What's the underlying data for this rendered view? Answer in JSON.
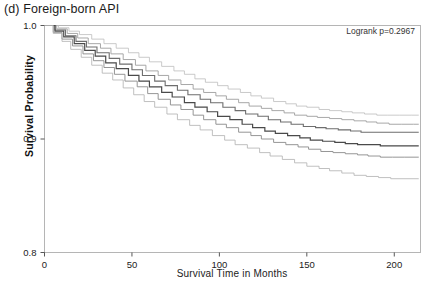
{
  "figure": {
    "panel_title": "(d) Foreign-born API",
    "annotation": "Logrank p=0.2967"
  },
  "chart_data": {
    "type": "line",
    "subtype": "kaplan-meier-step",
    "title": "(d) Foreign-born API",
    "xlabel": "Survival Time in Months",
    "ylabel": "Survival Probability",
    "annotations": [
      "Logrank p=0.2967"
    ],
    "grid": false,
    "legend_position": "none",
    "xlim": [
      0,
      215
    ],
    "ylim": [
      0.8,
      1.0
    ],
    "xticks": [
      0,
      50,
      100,
      150,
      200
    ],
    "xtick_labels": [
      "0",
      "50",
      "100",
      "150",
      "200"
    ],
    "yticks": [
      0.8,
      0.9,
      1.0
    ],
    "ytick_labels": [
      "0.8",
      "0.9",
      "1.0"
    ],
    "series": [
      {
        "name": "group-1",
        "color": "#bdbdbd",
        "width": 0.8,
        "x": [
          0,
          8,
          14,
          20,
          27,
          34,
          41,
          48,
          54,
          60,
          67,
          74,
          80,
          86,
          92,
          99,
          105,
          112,
          118,
          124,
          131,
          138,
          144,
          150,
          157,
          163,
          170,
          176,
          183,
          190,
          196,
          203,
          210,
          214
        ],
        "y": [
          1.0,
          0.998,
          0.995,
          0.992,
          0.988,
          0.984,
          0.98,
          0.976,
          0.972,
          0.968,
          0.964,
          0.96,
          0.957,
          0.953,
          0.95,
          0.947,
          0.944,
          0.941,
          0.938,
          0.936,
          0.933,
          0.931,
          0.929,
          0.928,
          0.926,
          0.925,
          0.924,
          0.923,
          0.922,
          0.921,
          0.921,
          0.921,
          0.921,
          0.921
        ]
      },
      {
        "name": "group-2",
        "color": "#9e9e9e",
        "width": 0.9,
        "x": [
          0,
          7,
          13,
          19,
          25,
          32,
          38,
          45,
          52,
          58,
          65,
          71,
          78,
          85,
          91,
          98,
          104,
          111,
          117,
          124,
          130,
          137,
          143,
          150,
          156,
          163,
          170,
          177,
          184,
          190,
          197,
          204,
          211,
          214
        ],
        "y": [
          1.0,
          0.997,
          0.993,
          0.989,
          0.984,
          0.98,
          0.975,
          0.97,
          0.965,
          0.96,
          0.956,
          0.952,
          0.948,
          0.944,
          0.941,
          0.938,
          0.935,
          0.932,
          0.929,
          0.927,
          0.925,
          0.923,
          0.921,
          0.92,
          0.919,
          0.918,
          0.917,
          0.916,
          0.915,
          0.914,
          0.913,
          0.913,
          0.913,
          0.913
        ]
      },
      {
        "name": "group-3",
        "color": "#6e6e6e",
        "width": 1.1,
        "x": [
          0,
          6,
          12,
          18,
          24,
          30,
          37,
          43,
          50,
          56,
          63,
          69,
          76,
          82,
          89,
          95,
          102,
          109,
          115,
          122,
          128,
          135,
          141,
          148,
          155,
          161,
          168,
          175,
          181,
          188,
          195,
          202,
          209,
          214
        ],
        "y": [
          1.0,
          0.996,
          0.991,
          0.986,
          0.981,
          0.976,
          0.971,
          0.966,
          0.961,
          0.956,
          0.951,
          0.947,
          0.943,
          0.939,
          0.935,
          0.932,
          0.928,
          0.925,
          0.922,
          0.92,
          0.917,
          0.915,
          0.913,
          0.911,
          0.91,
          0.909,
          0.908,
          0.907,
          0.906,
          0.906,
          0.906,
          0.906,
          0.906,
          0.906
        ]
      },
      {
        "name": "group-4",
        "color": "#4a4a4a",
        "width": 1.2,
        "x": [
          0,
          6,
          11,
          17,
          23,
          29,
          35,
          41,
          48,
          54,
          60,
          67,
          73,
          80,
          86,
          93,
          99,
          106,
          113,
          119,
          126,
          132,
          139,
          146,
          152,
          159,
          166,
          172,
          179,
          186,
          192,
          199,
          206,
          214
        ],
        "y": [
          1.0,
          0.995,
          0.99,
          0.984,
          0.978,
          0.973,
          0.967,
          0.962,
          0.956,
          0.951,
          0.946,
          0.941,
          0.937,
          0.932,
          0.928,
          0.924,
          0.92,
          0.917,
          0.913,
          0.91,
          0.907,
          0.905,
          0.903,
          0.901,
          0.899,
          0.898,
          0.897,
          0.896,
          0.895,
          0.895,
          0.894,
          0.894,
          0.894,
          0.894
        ]
      },
      {
        "name": "group-5",
        "color": "#8a8a8a",
        "width": 0.9,
        "x": [
          0,
          5,
          10,
          16,
          22,
          28,
          34,
          40,
          46,
          53,
          59,
          65,
          72,
          78,
          85,
          91,
          98,
          104,
          111,
          118,
          124,
          131,
          138,
          145,
          151,
          158,
          165,
          172,
          179,
          185,
          192,
          199,
          206,
          214
        ],
        "y": [
          1.0,
          0.994,
          0.988,
          0.982,
          0.975,
          0.969,
          0.963,
          0.957,
          0.951,
          0.946,
          0.94,
          0.935,
          0.93,
          0.926,
          0.921,
          0.917,
          0.913,
          0.91,
          0.906,
          0.903,
          0.9,
          0.897,
          0.895,
          0.893,
          0.891,
          0.889,
          0.888,
          0.887,
          0.886,
          0.885,
          0.884,
          0.884,
          0.884,
          0.884
        ]
      },
      {
        "name": "group-6",
        "color": "#b0b0b0",
        "width": 0.8,
        "x": [
          0,
          5,
          10,
          15,
          21,
          27,
          33,
          39,
          45,
          51,
          57,
          63,
          70,
          76,
          83,
          89,
          96,
          103,
          109,
          116,
          123,
          129,
          136,
          143,
          150,
          157,
          163,
          170,
          177,
          184,
          191,
          198,
          205,
          214
        ],
        "y": [
          1.0,
          0.993,
          0.986,
          0.979,
          0.972,
          0.965,
          0.958,
          0.952,
          0.945,
          0.939,
          0.933,
          0.928,
          0.922,
          0.917,
          0.912,
          0.908,
          0.903,
          0.899,
          0.895,
          0.892,
          0.888,
          0.885,
          0.882,
          0.879,
          0.876,
          0.874,
          0.872,
          0.87,
          0.868,
          0.867,
          0.866,
          0.865,
          0.865,
          0.865
        ]
      }
    ]
  }
}
